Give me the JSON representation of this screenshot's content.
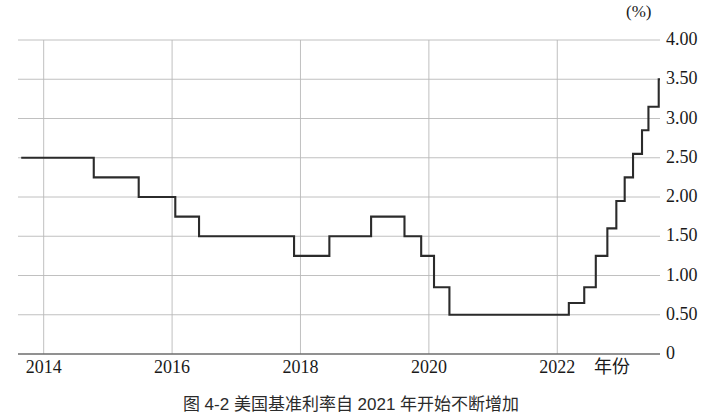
{
  "figure": {
    "caption": "图 4-2  美国基准利率自 2021 年开始不断增加",
    "unit_label": "(%)",
    "xaxis_title": "年份"
  },
  "chart_data": {
    "type": "line",
    "title": "美国基准利率自 2021 年开始不断增加",
    "xlabel": "年份",
    "ylabel": "(%)",
    "line_style": "step-post",
    "grid": true,
    "legend": "none",
    "xlim": [
      2013.6,
      2023.6
    ],
    "ylim": [
      0,
      4.0
    ],
    "xticks": [
      2014,
      2016,
      2018,
      2020,
      2022
    ],
    "xtick_labels": [
      "2014",
      "2016",
      "2018",
      "2020",
      "2022"
    ],
    "yticks": [
      0,
      0.5,
      1.0,
      1.5,
      2.0,
      2.5,
      3.0,
      3.5,
      4.0
    ],
    "ytick_labels": [
      "0",
      "0.50",
      "1.00",
      "1.50",
      "2.00",
      "2.50",
      "3.00",
      "3.50",
      "4.00"
    ],
    "line_color": "#2b2b2b",
    "grid_color": "#b9b9b9",
    "x": [
      2013.65,
      2014.6,
      2014.78,
      2015.48,
      2016.05,
      2016.42,
      2017.9,
      2018.45,
      2019.1,
      2019.62,
      2019.88,
      2020.08,
      2020.32,
      2021.95,
      2022.18,
      2022.42,
      2022.6,
      2022.78,
      2022.92,
      2023.05,
      2023.18,
      2023.32,
      2023.42,
      2023.58
    ],
    "y": [
      2.5,
      2.5,
      2.25,
      2.0,
      1.75,
      1.5,
      1.25,
      1.5,
      1.75,
      1.5,
      1.25,
      0.85,
      0.5,
      0.5,
      0.65,
      0.85,
      1.25,
      1.6,
      1.95,
      2.25,
      2.55,
      2.85,
      3.15,
      3.5
    ],
    "annotations": []
  }
}
